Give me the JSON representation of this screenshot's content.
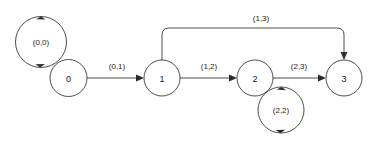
{
  "diagram": {
    "type": "state-transition-diagram",
    "background_color": "#ffffff",
    "stroke_color": "#3a3a3a",
    "text_color": "#1a1a1a",
    "nodes": [
      {
        "id": "0",
        "label": "0",
        "cx": 68.5,
        "cy": 78,
        "r": 18.5
      },
      {
        "id": "1",
        "label": "1",
        "cx": 162,
        "cy": 78,
        "r": 18
      },
      {
        "id": "2",
        "label": "2",
        "cx": 255,
        "cy": 78,
        "r": 18
      },
      {
        "id": "3",
        "label": "3",
        "cx": 344,
        "cy": 78,
        "r": 18
      }
    ],
    "edges": [
      {
        "id": "e-0-0",
        "from": "0",
        "to": "0",
        "label": "(0,0)",
        "kind": "self-loop",
        "label_x": 41,
        "label_y": 42
      },
      {
        "id": "e-0-1",
        "from": "0",
        "to": "1",
        "label": "(0,1)",
        "kind": "straight",
        "label_x": 117,
        "label_y": 66
      },
      {
        "id": "e-1-2",
        "from": "1",
        "to": "2",
        "label": "(1,2)",
        "kind": "straight",
        "label_x": 209,
        "label_y": 66
      },
      {
        "id": "e-2-3",
        "from": "2",
        "to": "3",
        "label": "(2,3)",
        "kind": "straight",
        "label_x": 299,
        "label_y": 66
      },
      {
        "id": "e-2-2",
        "from": "2",
        "to": "2",
        "label": "(2,2)",
        "kind": "self-loop",
        "label_x": 281,
        "label_y": 110
      },
      {
        "id": "e-1-3",
        "from": "1",
        "to": "3",
        "label": "(1,3)",
        "kind": "arc-top",
        "label_x": 261,
        "label_y": 18
      }
    ]
  }
}
